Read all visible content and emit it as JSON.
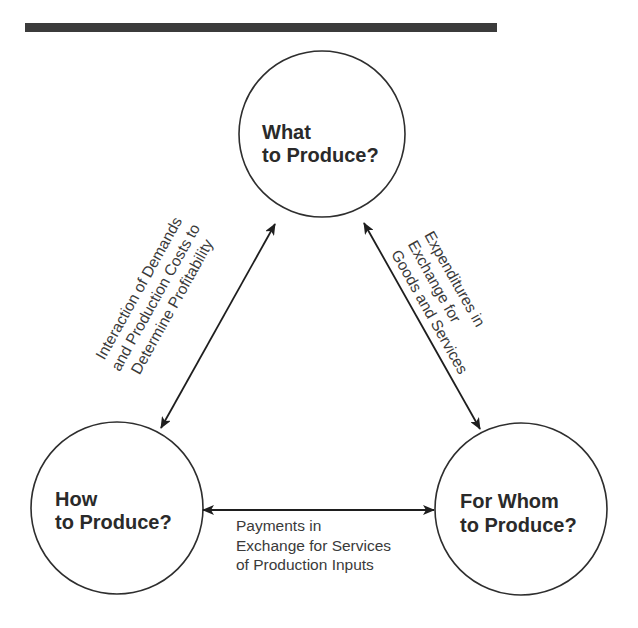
{
  "colors": {
    "rule": "#3b3b3b",
    "stroke": "#2e2e2e",
    "text": "#2a2a2a",
    "background": "#ffffff"
  },
  "nodes": {
    "what": {
      "line1": "What",
      "line2": "to Produce?"
    },
    "how": {
      "line1": "How",
      "line2": "to Produce?"
    },
    "for_whom": {
      "line1": "For Whom",
      "line2": "to Produce?"
    }
  },
  "edges": {
    "how_what": {
      "lines": [
        "Interaction of Demands",
        "and Production Costs to",
        "Determine Profitability"
      ]
    },
    "what_for_whom": {
      "lines": [
        "Expenditures in",
        "Exchange for",
        "Goods and Services"
      ]
    },
    "how_for_whom": {
      "lines": [
        "Payments in",
        "Exchange for Services",
        "of Production Inputs"
      ]
    }
  }
}
